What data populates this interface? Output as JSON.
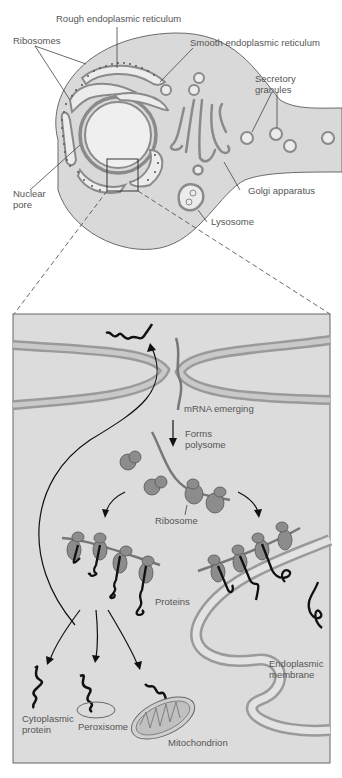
{
  "figure": {
    "top_panel": {
      "name": "secretory cell overview",
      "labels": {
        "rough_er": "Rough endoplasmic reticulum",
        "ribosomes": "Ribosomes",
        "smooth_er": "Smooth endoplasmic reticulum",
        "secretory_1": "Secretory",
        "secretory_2": "granules",
        "golgi": "Golgi apparatus",
        "nuclear_1": "Nuclear",
        "nuclear_2": "pore",
        "lysosome": "Lysosome"
      }
    },
    "bottom_panel": {
      "name": "magnified nuclear pore region",
      "labels": {
        "mrna": "mRNA emerging",
        "forms_1": "Forms",
        "forms_2": "polysome",
        "ribosome": "Ribosome",
        "proteins": "Proteins",
        "endo_1": "Endoplasmic",
        "endo_2": "membrane",
        "cyto_1": "Cytoplasmic",
        "cyto_2": "protein",
        "peroxisome": "Peroxisome",
        "mitochondrion": "Mitochondrion"
      }
    },
    "colors": {
      "cytoplasm": "#d9d9d9",
      "organelle_fill": "#ececec",
      "membrane": "#8a8a8a",
      "ribosome": "#8c8c8c",
      "protein": "#111111",
      "panel_bg": "#dcdcdc"
    }
  }
}
